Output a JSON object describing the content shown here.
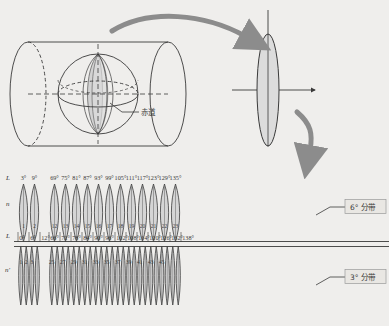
{
  "figure": {
    "title_present": false,
    "background_color": "#efeeec",
    "stroke_color": "#3a3a3a",
    "arrow_color": "#8c8c8c",
    "fill_color": "#d9d9d9"
  },
  "top_diagram": {
    "cylinder_label": "cylinder-projection",
    "globe_label": "globe-with-meridian-zones",
    "equator_callout": "赤道",
    "projected_gore_label": "projected-gore",
    "axis_vertical": "vertical-axis",
    "axis_horizontal": "horizontal-axis",
    "arrow_1": "curved-arrow-to-gore",
    "arrow_2": "curved-arrow-down"
  },
  "chart_data": {
    "type": "diagram",
    "bands": [
      {
        "name": "6° 分带",
        "callout": "6°  分带",
        "row_label_top": "L",
        "row_label_mid": "n",
        "row_label_bottom": "L",
        "central_meridians": [
          "3°",
          "9°",
          "69°",
          "75°",
          "81°",
          "87°",
          "93°",
          "99°",
          "105°",
          "111°",
          "117°",
          "123°",
          "129°",
          "135°"
        ],
        "zone_numbers": [
          "1",
          "2",
          "12",
          "13",
          "14",
          "15",
          "16",
          "17",
          "18",
          "19",
          "20",
          "21",
          "22",
          "23"
        ],
        "boundaries": [
          "0°",
          "6°",
          "12°",
          "66°",
          "72°",
          "78°",
          "84°",
          "90°",
          "96°",
          "102°",
          "108°",
          "114°",
          "120°",
          "126°",
          "132°",
          "138°"
        ],
        "zone_width_deg": 6
      },
      {
        "name": "3° 分带",
        "callout": "3°  分带",
        "row_label": "n'",
        "zone_numbers": [
          "1",
          "2",
          "3",
          "25",
          "27",
          "29",
          "31",
          "33",
          "35",
          "37",
          "39",
          "41",
          "43",
          "45"
        ],
        "zone_width_deg": 3
      }
    ],
    "gap_note": "series truncated between 12° and 66°",
    "xlabel": "经度 (longitude)",
    "ylabel": ""
  }
}
